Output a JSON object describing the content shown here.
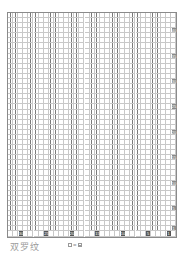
{
  "chart": {
    "title": "双罗纹",
    "pattern_type": "double rib (2x2)",
    "columns": 32,
    "rows": 43,
    "cell_width": 5.1,
    "cell_height": 5.08,
    "column_labels": [
      {
        "col": 30,
        "label": "30"
      },
      {
        "col": 25,
        "label": "25"
      },
      {
        "col": 20,
        "label": "20"
      },
      {
        "col": 15,
        "label": "15"
      },
      {
        "col": 10,
        "label": "10"
      },
      {
        "col": 5,
        "label": "5"
      },
      {
        "col": 1,
        "label": "1"
      }
    ],
    "row_labels": [
      {
        "row": 40,
        "label": "40"
      },
      {
        "row": 35,
        "label": "35"
      },
      {
        "row": 30,
        "label": "30"
      },
      {
        "row": 25,
        "label": "25"
      },
      {
        "row": 20,
        "label": "20"
      },
      {
        "row": 15,
        "label": "15"
      },
      {
        "row": 10,
        "label": "10"
      },
      {
        "row": 5,
        "label": "5"
      },
      {
        "row": 1,
        "label": "1"
      }
    ],
    "purl_columns_rule": "pairs of purl columns alternating with pairs of knit columns",
    "colors": {
      "grid_line": "#c8c8c8",
      "grid_border": "#8a8a8a",
      "purl_mark": "#7a7a7a",
      "label_bg": "#555555",
      "title_text": "#9a9a9a"
    }
  },
  "legend": {
    "lhs_symbol": "blank-square",
    "equals": "=",
    "rhs_symbol": "square-with-line",
    "text": "□=⊟"
  }
}
